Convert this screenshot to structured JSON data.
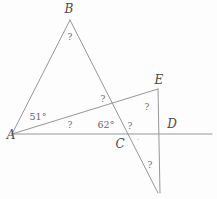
{
  "figure": {
    "type": "geometry-diagram",
    "width": 217,
    "height": 199,
    "background_color": "#fdfdfd",
    "stroke_color": "#8a8a8a",
    "text_color": "#5c5c5c",
    "stroke_width": 0.9
  },
  "points": {
    "A": {
      "label": "A",
      "x": 12,
      "y": 134,
      "label_x": 11,
      "label_y": 135
    },
    "B": {
      "label": "B",
      "x": 70,
      "y": 20,
      "label_x": 69,
      "label_y": 9
    },
    "C": {
      "label": "C",
      "x": 115,
      "y": 134,
      "label_x": 120,
      "label_y": 144
    },
    "D": {
      "label": "D",
      "x": 172,
      "y": 134,
      "label_x": 172,
      "label_y": 124
    },
    "E": {
      "label": "E",
      "x": 158,
      "y": 89,
      "label_x": 159,
      "label_y": 80
    }
  },
  "segments": [
    {
      "name": "segment-AB",
      "from": "A",
      "to": "B",
      "x1": 12,
      "y1": 134,
      "x2": 70,
      "y2": 20
    },
    {
      "name": "segment-B-to-lower-right",
      "from": "B",
      "to": "bottom-vertex",
      "x1": 70,
      "y1": 20,
      "x2": 158,
      "y2": 193
    },
    {
      "name": "segment-A-to-E",
      "from": "A",
      "to": "E",
      "x1": 12,
      "y1": 134,
      "x2": 158,
      "y2": 89
    },
    {
      "name": "baseline-A-through-D",
      "from": "A",
      "to": "right-edge",
      "x1": 12,
      "y1": 134,
      "x2": 212,
      "y2": 134
    },
    {
      "name": "segment-E-vertical",
      "from": "E",
      "to": "bottom-vertex",
      "x1": 158,
      "y1": 89,
      "x2": 160,
      "y2": 193
    }
  ],
  "angle_labels": [
    {
      "name": "angle-at-A-upper",
      "text": "51°",
      "x": 38,
      "y": 117
    },
    {
      "name": "angle-at-A-lower",
      "text": "?",
      "x": 70,
      "y": 125
    },
    {
      "name": "angle-at-C-left",
      "text": "62°",
      "x": 106,
      "y": 125
    },
    {
      "name": "angle-at-intersection-upper",
      "text": "?",
      "x": 103,
      "y": 99
    },
    {
      "name": "angle-at-B-apex",
      "text": "?",
      "x": 70,
      "y": 37
    },
    {
      "name": "angle-at-C-right",
      "text": "?",
      "x": 130,
      "y": 126
    },
    {
      "name": "angle-at-E-interior",
      "text": "?",
      "x": 147,
      "y": 107
    },
    {
      "name": "angle-at-bottom-vertex",
      "text": "?",
      "x": 150,
      "y": 165
    },
    {
      "name": "stray-degree-mark",
      "text": "·",
      "x": 138,
      "y": 140
    }
  ]
}
